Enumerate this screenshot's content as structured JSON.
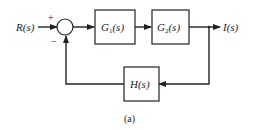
{
  "diagram": {
    "type": "block-diagram",
    "input": {
      "label": "R(s)"
    },
    "output": {
      "label": "I(s)"
    },
    "summing_junction": {
      "plus_sign": "+",
      "minus_sign": "−"
    },
    "blocks": [
      {
        "id": "G1",
        "label_main": "G",
        "label_sub": "1",
        "label_arg": "(s)"
      },
      {
        "id": "G2",
        "label_main": "G",
        "label_sub": "2",
        "label_arg": "(s)"
      },
      {
        "id": "H",
        "label_main": "H",
        "label_sub": "",
        "label_arg": "(s)"
      }
    ],
    "caption": "(a)",
    "colors": {
      "line": "#222222",
      "background": "#ffffff"
    }
  }
}
